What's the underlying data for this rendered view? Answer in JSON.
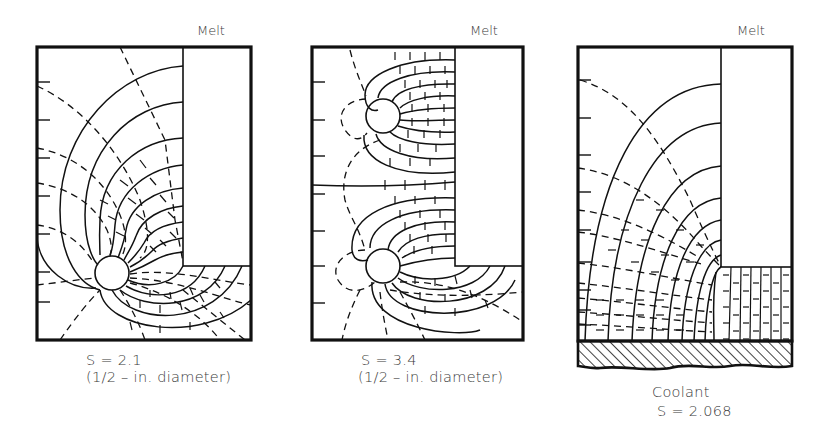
{
  "figure": {
    "panels": [
      {
        "id": "panel-1",
        "melt_label": "Melt",
        "caption_line1": "S = 2.1",
        "caption_line2": "(1/2 – in. diameter)",
        "frame": {
          "x": 37,
          "y": 47,
          "w": 214,
          "h": 293
        },
        "melt_block": {
          "x": 183,
          "y": 47,
          "w": 68,
          "h": 219
        },
        "pipes": [
          {
            "cx": 112,
            "cy": 273,
            "r": 17
          }
        ],
        "left_ticks_y": [
          82,
          120,
          158,
          196,
          234,
          272,
          302
        ],
        "shape_factor": 2.1
      },
      {
        "id": "panel-2",
        "melt_label": "Melt",
        "caption_line1": "S = 3.4",
        "caption_line2": "(1/2 – in. diameter)",
        "frame": {
          "x": 312,
          "y": 47,
          "w": 211,
          "h": 293
        },
        "melt_block": {
          "x": 455,
          "y": 47,
          "w": 68,
          "h": 219
        },
        "pipes": [
          {
            "cx": 383,
            "cy": 116,
            "r": 17
          },
          {
            "cx": 383,
            "cy": 266,
            "r": 17
          }
        ],
        "left_ticks_y": [
          82,
          120,
          156,
          194,
          231,
          266,
          303
        ],
        "shape_factor": 3.4
      },
      {
        "id": "panel-3",
        "melt_label": "Melt",
        "caption_line1": "Coolant",
        "caption_line2": "S = 2.068",
        "frame": {
          "x": 578,
          "y": 47,
          "w": 214,
          "h": 294
        },
        "melt_block": {
          "x": 721,
          "y": 47,
          "w": 71,
          "h": 220
        },
        "coolant_strip": {
          "x": 578,
          "y": 341,
          "w": 214,
          "h": 26
        },
        "left_ticks_y": [
          80,
          118,
          155,
          192,
          230,
          262,
          290,
          310,
          325
        ],
        "shape_factor": 2.068
      }
    ],
    "colors": {
      "ink": "#111111",
      "text": "#3a3a3a",
      "background": "#ffffff"
    }
  }
}
